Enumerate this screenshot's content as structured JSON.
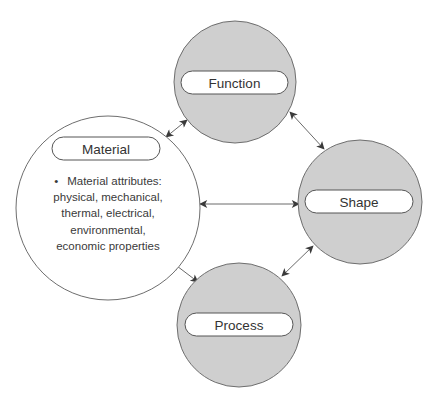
{
  "diagram": {
    "title": "",
    "colors": {
      "background": "#ffffff",
      "gray_node_fill": "#cfcfcf",
      "white_node_fill": "#ffffff",
      "node_stroke": "#6e6e6e",
      "arrow": "#6a6a6a",
      "text": "#333333"
    },
    "nodes": [
      {
        "id": "material",
        "label": "Material",
        "shape": "circle",
        "fill": "#ffffff",
        "cx": 108,
        "cy": 208,
        "r": 92,
        "pill": {
          "x": 52,
          "y": 137,
          "w": 108,
          "h": 23
        },
        "bullets": [
          {
            "marker": "•",
            "lines": [
              "Material attributes:",
              "physical, mechanical,",
              "thermal, electrical,",
              "environmental,",
              "economic properties"
            ]
          }
        ]
      },
      {
        "id": "function",
        "label": "Function",
        "shape": "circle",
        "fill": "#cfcfcf",
        "cx": 235,
        "cy": 82,
        "r": 61,
        "pill": {
          "x": 181,
          "y": 71,
          "w": 107,
          "h": 23
        }
      },
      {
        "id": "shape",
        "label": "Shape",
        "shape": "circle",
        "fill": "#cfcfcf",
        "cx": 360,
        "cy": 202,
        "r": 62,
        "pill": {
          "x": 305,
          "y": 190,
          "w": 108,
          "h": 23
        }
      },
      {
        "id": "process",
        "label": "Process",
        "shape": "circle",
        "fill": "#cfcfcf",
        "cx": 239,
        "cy": 325,
        "r": 62,
        "pill": {
          "x": 185,
          "y": 313,
          "w": 108,
          "h": 23
        }
      }
    ],
    "edges": [
      {
        "from": "material",
        "to": "function",
        "direction": "both",
        "x1": 166,
        "y1": 137,
        "x2": 187,
        "y2": 120
      },
      {
        "from": "function",
        "to": "shape",
        "direction": "both",
        "x1": 290,
        "y1": 112,
        "x2": 324,
        "y2": 149
      },
      {
        "from": "material",
        "to": "shape",
        "direction": "both",
        "x1": 200,
        "y1": 204,
        "x2": 299,
        "y2": 204
      },
      {
        "from": "material",
        "to": "process",
        "direction": "both",
        "x1": 173,
        "y1": 263,
        "x2": 198,
        "y2": 282
      },
      {
        "from": "shape",
        "to": "process",
        "direction": "both",
        "x1": 313,
        "y1": 246,
        "x2": 282,
        "y2": 276
      }
    ]
  }
}
